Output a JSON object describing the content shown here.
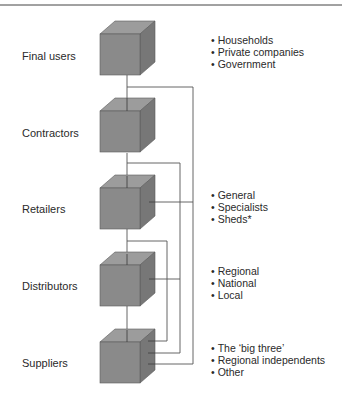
{
  "diagram": {
    "levels": [
      {
        "label": "Final users",
        "bullets": [
          "Households",
          "Private companies",
          "Government"
        ]
      },
      {
        "label": "Contractors",
        "bullets": []
      },
      {
        "label": "Retailers",
        "bullets": [
          "General",
          "Specialists",
          "Sheds*"
        ]
      },
      {
        "label": "Distributors",
        "bullets": [
          "Regional",
          "National",
          "Local"
        ]
      },
      {
        "label": "Suppliers",
        "bullets": [
          "The ‘big three’",
          "Regional independents",
          "Other"
        ]
      }
    ],
    "colors": {
      "cube_front": "#8a8a8a",
      "cube_top": "#9c9c9c",
      "cube_side": "#777777",
      "line": "#555555"
    }
  }
}
